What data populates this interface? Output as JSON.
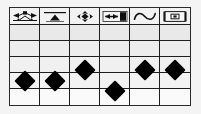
{
  "figure": {
    "background_color": "#fefefe",
    "frame_color": "#2a2a2a",
    "gridline_color": "#1e1e1e",
    "marker_color": "#000000",
    "header_fill": "#f2f2f2"
  },
  "columns": [
    {
      "id": "col-1",
      "icon_name": "bowtie-knot-icon",
      "label": ""
    },
    {
      "id": "col-2",
      "icon_name": "triangle-under-bar-icon",
      "label": ""
    },
    {
      "id": "col-3",
      "icon_name": "four-way-arrows-icon",
      "label": ""
    },
    {
      "id": "col-4",
      "icon_name": "gradient-bar-icon",
      "label": ""
    },
    {
      "id": "col-5",
      "icon_name": "sine-wave-icon",
      "label": ""
    },
    {
      "id": "col-6",
      "icon_name": "film-frame-icon",
      "label": ""
    }
  ],
  "rows": [
    {
      "id": "row-1",
      "band": "band-a"
    },
    {
      "id": "row-2",
      "band": "band-b"
    },
    {
      "id": "row-3",
      "band": "band-c"
    },
    {
      "id": "row-4",
      "band": "band-d"
    },
    {
      "id": "row-5",
      "band": "band-e"
    }
  ],
  "chart_data": {
    "type": "scatter",
    "title": "",
    "subtitle": "",
    "xlabel": "",
    "ylabel": "",
    "grid": true,
    "legend": null,
    "categories": [
      "bowtie-knot-icon",
      "triangle-under-bar-icon",
      "four-way-arrows-icon",
      "gradient-bar-icon",
      "sine-wave-icon",
      "film-frame-icon"
    ],
    "x": [
      1,
      2,
      3,
      4,
      5,
      6
    ],
    "values": [
      2,
      2,
      3,
      1,
      3,
      3
    ],
    "ylim": [
      0,
      5
    ],
    "yticks": [
      0,
      1,
      2,
      3,
      4,
      5
    ],
    "marker": "diamond",
    "points": [
      {
        "category": "bowtie-knot-icon",
        "column": 1,
        "value": 2,
        "x_pct": 8.4,
        "y_pct": 75.0
      },
      {
        "category": "triangle-under-bar-icon",
        "column": 2,
        "value": 2,
        "x_pct": 25.1,
        "y_pct": 75.0
      },
      {
        "category": "four-way-arrows-icon",
        "column": 3,
        "value": 3,
        "x_pct": 41.8,
        "y_pct": 64.0
      },
      {
        "category": "gradient-bar-icon",
        "column": 4,
        "value": 1,
        "x_pct": 58.5,
        "y_pct": 86.0
      },
      {
        "category": "sine-wave-icon",
        "column": 5,
        "value": 3,
        "x_pct": 75.2,
        "y_pct": 64.0
      },
      {
        "category": "film-frame-icon",
        "column": 6,
        "value": 3,
        "x_pct": 91.8,
        "y_pct": 64.0
      }
    ]
  }
}
